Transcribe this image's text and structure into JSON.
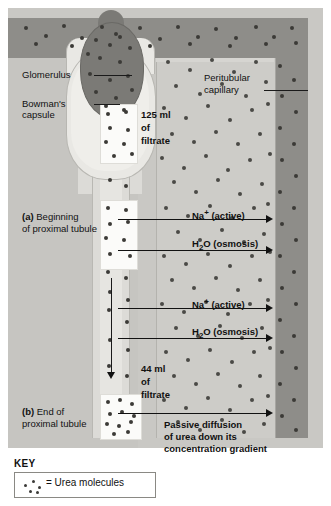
{
  "figure": {
    "structures": {
      "glomerulus_label": "Glomerulus",
      "bowmans_capsule_label_line1": "Bowman's",
      "bowmans_capsule_label_line2": "capsule",
      "peritubular_capillary_line1": "Peritubular",
      "peritubular_capillary_line2": "capillary"
    },
    "filtrate_top": {
      "volume": "125 ml",
      "of": "of",
      "noun": "filtrate"
    },
    "filtrate_bottom": {
      "volume": "44 ml",
      "of": "of",
      "noun": "filtrate"
    },
    "stage_a": {
      "marker": "(a)",
      "line1": "Beginning",
      "line2": "of proximal tubule"
    },
    "stage_b": {
      "marker": "(b)",
      "line1": "End of",
      "line2": "proximal tubule"
    },
    "transport": [
      {
        "sodium": "Na",
        "sodium_charge": "+",
        "sodium_mode": "(active)"
      },
      {
        "water_h": "H",
        "water_sub": "2",
        "water_o": "O",
        "water_mode": "(osmosis)"
      }
    ],
    "transport_group_1": {
      "sodium_full": "Na+ (active)",
      "water_full": "H2O (osmosis)"
    },
    "transport_group_2": {
      "sodium_full": "Na+ (active)",
      "water_full": "H2O (osmosis)"
    },
    "passive_diffusion": {
      "line1": "Passive diffusion",
      "line2": "of urea down its",
      "line3": "concentration gradient"
    }
  },
  "key": {
    "title": "KEY",
    "equals_label": "= Urea molecules"
  },
  "colors": {
    "vessel_dark": "#8e8d89",
    "capillary_light": "#cdccc8",
    "background_gray": "#c9c8c4",
    "glomerulus": "#7b7a76",
    "capsule": "#e9e8e4",
    "filtrate_white": "#fbfbf9",
    "urea_dot": "#4a4a46",
    "text": "#111111"
  },
  "dots": {
    "vessel_top": [
      [
        16,
        18
      ],
      [
        36,
        26
      ],
      [
        54,
        16
      ],
      [
        72,
        28
      ],
      [
        92,
        17
      ],
      [
        110,
        27
      ],
      [
        130,
        18
      ],
      [
        150,
        29
      ],
      [
        168,
        17
      ],
      [
        188,
        27
      ],
      [
        206,
        19
      ],
      [
        226,
        28
      ],
      [
        246,
        17
      ],
      [
        264,
        27
      ],
      [
        282,
        18
      ],
      [
        26,
        34
      ],
      [
        62,
        36
      ],
      [
        100,
        35
      ],
      [
        140,
        36
      ],
      [
        180,
        34
      ],
      [
        220,
        36
      ],
      [
        256,
        34
      ],
      [
        286,
        33
      ]
    ],
    "vessel_right": [
      [
        270,
        56
      ],
      [
        284,
        70
      ],
      [
        272,
        86
      ],
      [
        286,
        102
      ],
      [
        270,
        118
      ],
      [
        284,
        134
      ],
      [
        272,
        150
      ],
      [
        286,
        166
      ],
      [
        270,
        182
      ],
      [
        284,
        198
      ],
      [
        272,
        214
      ],
      [
        286,
        230
      ],
      [
        270,
        246
      ],
      [
        284,
        262
      ],
      [
        272,
        278
      ],
      [
        286,
        294
      ],
      [
        270,
        310
      ],
      [
        284,
        326
      ],
      [
        272,
        342
      ],
      [
        286,
        358
      ],
      [
        270,
        374
      ],
      [
        284,
        390
      ],
      [
        272,
        406
      ],
      [
        286,
        420
      ]
    ],
    "glomerulus": [
      [
        86,
        30
      ],
      [
        106,
        24
      ],
      [
        120,
        38
      ],
      [
        90,
        48
      ],
      [
        110,
        52
      ],
      [
        80,
        64
      ],
      [
        100,
        70
      ],
      [
        118,
        66
      ],
      [
        86,
        82
      ],
      [
        106,
        88
      ],
      [
        122,
        80
      ],
      [
        96,
        96
      ],
      [
        114,
        100
      ],
      [
        78,
        44
      ]
    ],
    "capillary": [
      [
        158,
        52
      ],
      [
        180,
        60
      ],
      [
        202,
        50
      ],
      [
        224,
        62
      ],
      [
        246,
        52
      ],
      [
        166,
        76
      ],
      [
        190,
        84
      ],
      [
        212,
        74
      ],
      [
        236,
        86
      ],
      [
        256,
        72
      ],
      [
        154,
        98
      ],
      [
        176,
        108
      ],
      [
        198,
        96
      ],
      [
        220,
        110
      ],
      [
        242,
        100
      ],
      [
        258,
        94
      ],
      [
        162,
        124
      ],
      [
        184,
        132
      ],
      [
        206,
        122
      ],
      [
        228,
        134
      ],
      [
        250,
        124
      ],
      [
        152,
        148
      ],
      [
        174,
        158
      ],
      [
        196,
        146
      ],
      [
        218,
        160
      ],
      [
        240,
        150
      ],
      [
        260,
        144
      ],
      [
        164,
        172
      ],
      [
        186,
        182
      ],
      [
        208,
        170
      ],
      [
        230,
        184
      ],
      [
        252,
        174
      ],
      [
        156,
        198
      ],
      [
        178,
        206
      ],
      [
        200,
        196
      ],
      [
        222,
        208
      ],
      [
        244,
        198
      ],
      [
        258,
        194
      ],
      [
        168,
        222
      ],
      [
        190,
        230
      ],
      [
        212,
        220
      ],
      [
        234,
        232
      ],
      [
        254,
        224
      ],
      [
        154,
        246
      ],
      [
        176,
        254
      ],
      [
        198,
        244
      ],
      [
        220,
        256
      ],
      [
        242,
        246
      ],
      [
        260,
        242
      ],
      [
        162,
        270
      ],
      [
        184,
        278
      ],
      [
        206,
        268
      ],
      [
        228,
        280
      ],
      [
        250,
        270
      ],
      [
        152,
        294
      ],
      [
        174,
        302
      ],
      [
        196,
        292
      ],
      [
        218,
        304
      ],
      [
        240,
        294
      ],
      [
        258,
        290
      ],
      [
        166,
        318
      ],
      [
        188,
        326
      ],
      [
        210,
        316
      ],
      [
        232,
        328
      ],
      [
        252,
        318
      ],
      [
        156,
        342
      ],
      [
        178,
        350
      ],
      [
        200,
        340
      ],
      [
        222,
        352
      ],
      [
        244,
        342
      ],
      [
        260,
        338
      ],
      [
        164,
        366
      ],
      [
        186,
        374
      ],
      [
        208,
        364
      ],
      [
        230,
        376
      ],
      [
        250,
        366
      ],
      [
        154,
        390
      ],
      [
        176,
        398
      ],
      [
        198,
        388
      ],
      [
        220,
        400
      ],
      [
        242,
        390
      ],
      [
        258,
        386
      ],
      [
        168,
        412
      ],
      [
        190,
        420
      ],
      [
        212,
        410
      ],
      [
        234,
        422
      ],
      [
        254,
        414
      ]
    ],
    "filtrate_top": [
      [
        98,
        104
      ],
      [
        116,
        102
      ],
      [
        100,
        118
      ],
      [
        118,
        120
      ],
      [
        96,
        132
      ],
      [
        114,
        134
      ],
      [
        104,
        146
      ],
      [
        122,
        144
      ]
    ],
    "filtrate_mid": [
      [
        98,
        198
      ],
      [
        116,
        200
      ],
      [
        100,
        214
      ],
      [
        118,
        212
      ],
      [
        96,
        228
      ],
      [
        114,
        230
      ],
      [
        100,
        244
      ],
      [
        120,
        246
      ]
    ],
    "filtrate_end": [
      [
        98,
        392
      ],
      [
        110,
        390
      ],
      [
        122,
        394
      ],
      [
        100,
        404
      ],
      [
        112,
        402
      ],
      [
        124,
        406
      ],
      [
        97,
        414
      ],
      [
        109,
        416
      ],
      [
        121,
        412
      ],
      [
        104,
        424
      ],
      [
        118,
        422
      ]
    ],
    "tubule_strip": [
      [
        100,
        170
      ],
      [
        116,
        176
      ],
      [
        98,
        262
      ],
      [
        116,
        268
      ],
      [
        100,
        282
      ],
      [
        118,
        290
      ],
      [
        99,
        300
      ],
      [
        117,
        312
      ],
      [
        100,
        330
      ],
      [
        118,
        340
      ],
      [
        99,
        356
      ],
      [
        117,
        366
      ]
    ],
    "key_icon": [
      [
        4,
        10
      ],
      [
        12,
        6
      ],
      [
        18,
        12
      ],
      [
        9,
        16
      ],
      [
        16,
        17
      ]
    ]
  }
}
